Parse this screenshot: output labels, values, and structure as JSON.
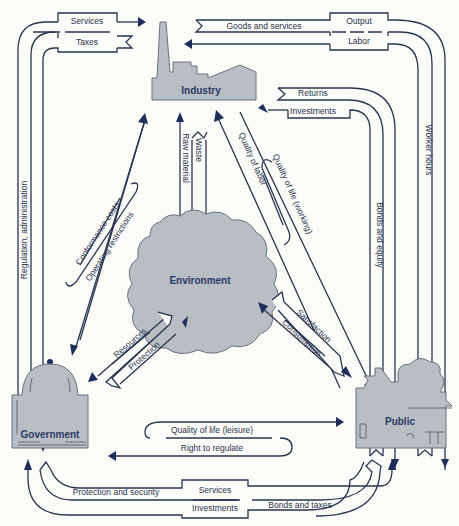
{
  "nodes": {
    "industry": "Industry",
    "environment": "Environment",
    "government": "Government",
    "public": "Public"
  },
  "flows": {
    "services_top": "Services",
    "taxes": "Taxes",
    "goods_and_services": "Goods and services",
    "output": "Output",
    "labor": "Labor",
    "returns": "Returns",
    "investments_top": "Investments",
    "regulation_administration": "Regulation, administration",
    "worker_hours": "Worker hours",
    "bonds_and_equity": "Bonds and equity",
    "raw_material": "Raw material",
    "waste": "Waste",
    "quality_of_labor": "Quality of labor",
    "quality_of_life_working": "Quality of life (working)",
    "conformance_costs": "Conformance costs",
    "operating_restrictions": "Operating restrictions",
    "resources": "Resources",
    "protection": "Protection",
    "satisfaction": "Satisfaction",
    "consumption": "Consumption",
    "quality_of_life_leisure": "Quality of life (leisure)",
    "right_to_regulate": "Right to regulate",
    "protection_and_security": "Protection and security",
    "services_bottom": "Services",
    "investments_bottom": "Investments",
    "bonds_and_taxes": "Bonds and taxes"
  },
  "colors": {
    "line": "#2a3550",
    "arrowhead": "#1f2d5a",
    "node_fill": "#b9bdc4",
    "background": "#fbfbf8"
  }
}
